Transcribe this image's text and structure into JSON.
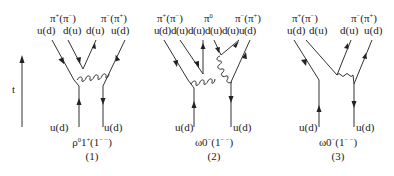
{
  "time_axis": {
    "label": "t"
  },
  "diagrams": [
    {
      "number": "(1)",
      "caption": {
        "base": "ρ",
        "sup1": "0",
        "mid": "1",
        "sup2": "+",
        "open": "(1",
        "sup3": "− −",
        "close": ")"
      },
      "top_mesons": [
        {
          "base": "π",
          "sup": "+",
          "paren_base": "(π",
          "paren_sup": "−",
          "close": ")"
        },
        {
          "base": "π",
          "sup": "−",
          "paren_base": "(π",
          "paren_sup": "+",
          "close": ")"
        }
      ],
      "top_quarks": [
        "u(d)",
        "d(u)",
        "d(u)",
        "u(d)"
      ],
      "bottom_quarks": [
        "u(d)",
        "u(d)"
      ]
    },
    {
      "number": "(2)",
      "caption": {
        "base": "ω0",
        "sup1": "−",
        "open": "(1",
        "sup3": "− −",
        "close": ")"
      },
      "top_mesons": [
        {
          "base": "π",
          "sup": "+",
          "paren_base": "(π",
          "paren_sup": "−",
          "close": ")"
        },
        {
          "base": "π",
          "sup": "0"
        },
        {
          "base": "π",
          "sup": "−",
          "paren_base": "(π",
          "paren_sup": "+",
          "close": ")"
        }
      ],
      "top_quarks": [
        "u(d)",
        "d(u)",
        "d(u)",
        "d(u)",
        "d(u)",
        "u(d)"
      ],
      "bottom_quarks": [
        "u(d)",
        "u(d)"
      ]
    },
    {
      "number": "(3)",
      "caption": {
        "base": "ω0",
        "sup1": "−",
        "open": "(1",
        "sup3": "− −",
        "close": ")"
      },
      "top_mesons": [
        {
          "base": "π",
          "sup": "+",
          "paren_base": "(π",
          "paren_sup": "−",
          "close": ")"
        },
        {
          "base": "π",
          "sup": "−",
          "paren_base": "(π",
          "paren_sup": "+",
          "close": ")"
        }
      ],
      "top_quarks": [
        "u(d)",
        "d(u)",
        "d(u)",
        "u(d)"
      ],
      "bottom_quarks": [
        "u(d)",
        "u(d)"
      ]
    }
  ]
}
